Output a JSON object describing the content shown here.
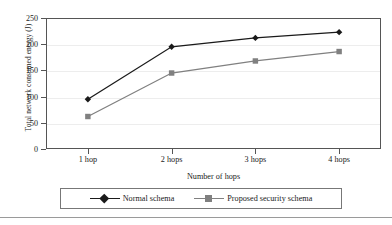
{
  "chart_data": {
    "type": "line",
    "title": "",
    "xlabel": "Number of hops",
    "ylabel": "Total network consumed energy (J)",
    "categories": [
      "1 hop",
      "2 hops",
      "3 hops",
      "4 hops"
    ],
    "ylim": [
      0,
      250
    ],
    "yticks": [
      0,
      50,
      100,
      150,
      200,
      250
    ],
    "ytick_labels": [
      "0",
      "50",
      "100",
      "150",
      "200",
      "250"
    ],
    "grid": true,
    "legend_position": "bottom",
    "series": [
      {
        "name": "Normal schema",
        "values": [
          95,
          195,
          212,
          223
        ],
        "color": "#1a1a1a",
        "marker": "diamond"
      },
      {
        "name": "Proposed security schema",
        "values": [
          62,
          145,
          168,
          186
        ],
        "color": "#808080",
        "marker": "square"
      }
    ]
  },
  "axes": {
    "y_title": "Total network consumed energy (J)",
    "x_title": "Number of hops"
  },
  "legend": {
    "entries": [
      {
        "label": "Normal schema",
        "color": "#1a1a1a",
        "marker": "diamond-marker-icon"
      },
      {
        "label": "Proposed security schema",
        "color": "#808080",
        "marker": "square-marker-icon"
      }
    ]
  },
  "colors": {
    "series_normal": "#1a1a1a",
    "series_proposed": "#808080",
    "axis": "#555555",
    "grid": "#ededed",
    "background": "#ffffff"
  }
}
